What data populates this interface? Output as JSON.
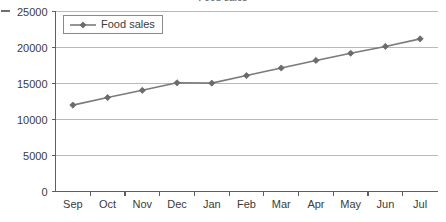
{
  "chart_data": {
    "type": "line",
    "title": "Food sales",
    "xlabel": "",
    "ylabel": "",
    "categories": [
      "Sep",
      "Oct",
      "Nov",
      "Dec",
      "Jan",
      "Feb",
      "Mar",
      "Apr",
      "May",
      "Jun",
      "Jul"
    ],
    "series": [
      {
        "name": "Food sales",
        "values": [
          12000,
          13050,
          14050,
          15100,
          15050,
          16100,
          17150,
          18200,
          19200,
          20150,
          21200
        ],
        "color": "#7a7a7a",
        "marker": "diamond"
      }
    ],
    "ylim": [
      0,
      25000
    ],
    "yticks": [
      0,
      5000,
      10000,
      15000,
      20000,
      25000
    ],
    "ytick_labels": [
      "0",
      "5000",
      "10000",
      "15000",
      "20000",
      "25000"
    ],
    "grid": true,
    "grid_axis": "y",
    "legend": {
      "position": "top-left-inside",
      "entries": [
        "Food sales"
      ]
    }
  },
  "style": {
    "line_color": "#7a7a7a",
    "marker_color": "#6b6b6b",
    "grid_color": "#b9b9b9",
    "axis_color": "#5f5f5f",
    "text_color": "#3b3b3b",
    "background": "#ffffff"
  }
}
